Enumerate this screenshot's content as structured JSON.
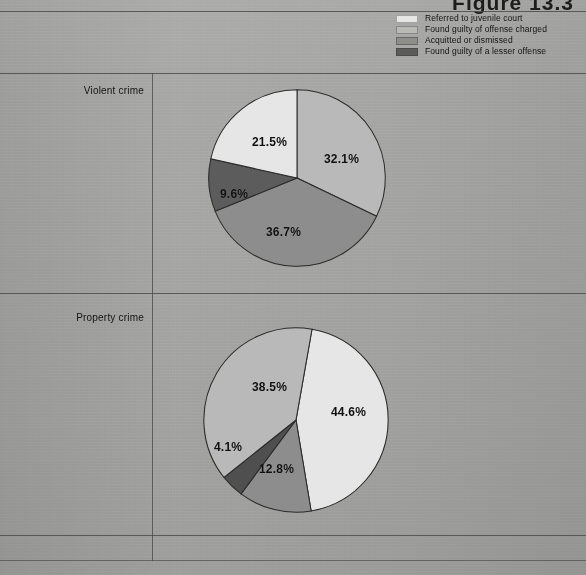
{
  "figure": {
    "title": "Figure 13.3"
  },
  "legend": {
    "items": [
      {
        "label": "Referred to juvenile court",
        "color": "#e6e6e2",
        "icon": "legend-swatch-icon"
      },
      {
        "label": "Found guilty of offense charged",
        "color": "#b9b9b5",
        "icon": "legend-swatch-icon"
      },
      {
        "label": "Acquitted or dismissed",
        "color": "#8d8d8a",
        "icon": "legend-swatch-icon"
      },
      {
        "label": "Found guilty of a lesser offense",
        "color": "#5c5c5a",
        "icon": "legend-swatch-icon"
      }
    ]
  },
  "rows": [
    {
      "label": "Violent crime"
    },
    {
      "label": "Property crime"
    }
  ],
  "chart_data": [
    {
      "type": "pie",
      "title": "Violent crime",
      "categories": [
        "Found guilty of offense charged",
        "Acquitted or dismissed",
        "Found guilty of a lesser offense",
        "Referred to juvenile court"
      ],
      "values": [
        32.1,
        36.7,
        9.6,
        21.5
      ],
      "labels": [
        "32.1%",
        "36.7%",
        "9.6%",
        "21.5%"
      ],
      "colors": [
        "#b9b9b5",
        "#8d8d8a",
        "#5c5c5a",
        "#e6e6e2"
      ],
      "units": "percent",
      "start_angle_deg": 0,
      "direction": "clockwise",
      "legend_position": "top-right"
    },
    {
      "type": "pie",
      "title": "Property crime",
      "categories": [
        "Referred to juvenile court",
        "Found guilty of offense charged",
        "Found guilty of a lesser offense",
        "Acquitted or dismissed"
      ],
      "values": [
        44.6,
        12.8,
        4.1,
        38.5
      ],
      "labels": [
        "44.6%",
        "12.8%",
        "4.1%",
        "38.5%"
      ],
      "colors": [
        "#e6e6e2",
        "#8d8d8a",
        "#4f4f4d",
        "#b9b9b5"
      ],
      "units": "percent",
      "start_angle_deg": 10,
      "direction": "clockwise",
      "legend_position": "top-right"
    }
  ]
}
